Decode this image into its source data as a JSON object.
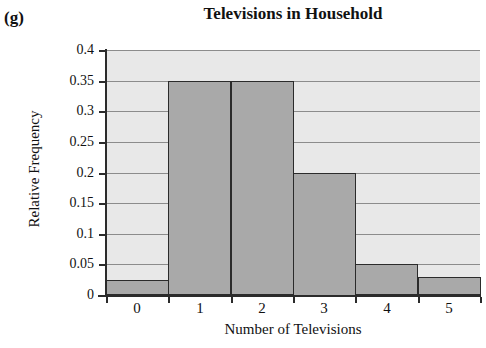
{
  "panel": {
    "label": "(g)"
  },
  "chart_data": {
    "type": "bar",
    "title": "Televisions in Household",
    "xlabel": "Number of Televisions",
    "ylabel": "Relative Frequency",
    "categories": [
      "0",
      "1",
      "2",
      "3",
      "4",
      "5"
    ],
    "values": [
      0.025,
      0.35,
      0.35,
      0.2,
      0.05,
      0.03
    ],
    "ylim": [
      0,
      0.4
    ],
    "xlim": [
      -0.5,
      5.5
    ],
    "ytick_labels": [
      "0.4",
      "0.35",
      "0.3",
      "0.25",
      "0.2",
      "0.15",
      "0.1",
      "0.05",
      "0"
    ],
    "ytick_values": [
      0.4,
      0.35,
      0.3,
      0.25,
      0.2,
      0.15,
      0.1,
      0.05,
      0
    ],
    "xtick_labels": [
      "0",
      "1",
      "2",
      "3",
      "4",
      "5"
    ],
    "grid": "horizontal",
    "legend": "none",
    "bar_fill_color": "#a9a9a9",
    "bar_edge_color": "#2b2b2b",
    "plot_background_color": "#e8e8e8",
    "gridline_color": "#8c8c8c",
    "axis_color": "#2b2b2b"
  }
}
